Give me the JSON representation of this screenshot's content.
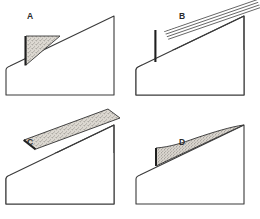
{
  "figure": {
    "kind": "technical-line-diagram",
    "width": 260,
    "height": 219,
    "background_color": "#ffffff",
    "line_color": "#3a3a3a",
    "heavy_line_color": "#1f1f1f",
    "stipple_fill_color": "#ded9d2",
    "stipple_dot_color": "#7d7a74",
    "stripe_line_color": "#4a4a4a",
    "panel_count": 4
  },
  "panels": [
    {
      "id": "A",
      "label": "A",
      "label_x": 30,
      "label_y": 19,
      "overlay_kind": "stippled-right-triangle",
      "overlay_description": "small stippled right triangle wedge resting on the lower slope, vertical left face, horizontal top edge, hypotenuse along the ramp slope",
      "base_shape": "ramp-wedge",
      "origin_x": 4,
      "origin_y": 4
    },
    {
      "id": "B",
      "label": "B",
      "label_x": 182,
      "label_y": 19,
      "overlay_kind": "parallel-striped-band",
      "overlay_description": "band of five parallel diagonal stripes lying on the slope and projecting beyond the apex to the upper right",
      "stripe_count": 5,
      "base_shape": "ramp-wedge",
      "origin_x": 134,
      "origin_y": 4
    },
    {
      "id": "C",
      "label": "C",
      "label_x": 30,
      "label_y": 142,
      "overlay_kind": "stippled-band-with-dividers",
      "overlay_description": "thick stippled band of uniform width following the slope with three internal cross dividing lines, projecting beyond the apex",
      "divider_count": 3,
      "base_shape": "ramp-wedge",
      "origin_x": 4,
      "origin_y": 113
    },
    {
      "id": "D",
      "label": "D",
      "label_x": 182,
      "label_y": 143,
      "overlay_kind": "tapering-concave-wedge",
      "overlay_description": "stippled wedge thick at the lower slope and tapering with a concave upper edge to a point at the apex",
      "base_shape": "ramp-wedge",
      "origin_x": 134,
      "origin_y": 113
    }
  ]
}
